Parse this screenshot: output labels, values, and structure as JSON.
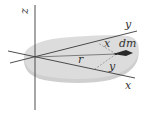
{
  "diagram": {
    "axes": {
      "z_label": "z",
      "y_label": "y",
      "x_label": "x"
    },
    "element": {
      "mass_label": "dm",
      "x_distance_label": "x",
      "y_distance_label": "y",
      "radius_label": "r"
    },
    "colors": {
      "lamina_fill": "#d9d9d9",
      "lamina_edge": "#c4c4c4",
      "axis_line": "#3a3a3a",
      "dashed": "#777777",
      "text": "#333333"
    }
  }
}
